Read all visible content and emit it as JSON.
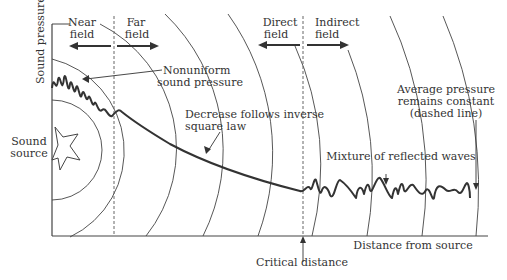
{
  "diagram": {
    "type": "sound-field-diagram",
    "axes": {
      "y_label": "Sound pressure",
      "x_label": "Distance from source"
    },
    "regions": {
      "near_field": "Near\nfield",
      "far_field": "Far\nfield",
      "direct_field": "Direct\nfield",
      "indirect_field": "Indirect\nfield"
    },
    "labels": {
      "near_line1": "Near",
      "near_line2": "field",
      "far_line1": "Far",
      "far_line2": "field",
      "direct_line1": "Direct",
      "direct_line2": "field",
      "indirect_line1": "Indirect",
      "indirect_line2": "field",
      "nonuniform_line1": "Nonuniform",
      "nonuniform_line2": "sound pressure",
      "decrease_line1": "Decrease follows inverse",
      "decrease_line2": "square law",
      "average_line1": "Average pressure",
      "average_line2": "remains constant",
      "average_line3": "(dashed line)",
      "mixture": "Mixture of reflected waves",
      "source_line1": "Sound",
      "source_line2": "source",
      "critical_distance": "Critical distance"
    },
    "colors": {
      "ink": "#333333",
      "background": "#ffffff"
    }
  }
}
